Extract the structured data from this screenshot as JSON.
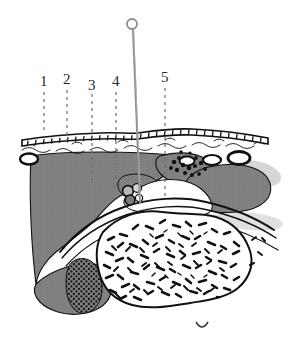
{
  "figure": {
    "kind": "anatomical-cross-section",
    "background_color": "#ffffff"
  },
  "palette": {
    "outline": "#111111",
    "soft_tissue_gray": "#808080",
    "soft_tissue_gray_dark": "#6f6f6f",
    "cartilage_white": "#ffffff",
    "needle_gray": "#8a8a8a",
    "label_color": "#2b2b2b",
    "leader_color": "#6b6b6b",
    "shadow_gray": "#cfcfcf"
  },
  "labels": [
    {
      "id": "label-1",
      "text": "1",
      "x": 40,
      "y": 74,
      "leader_x": 44,
      "leader_y_start": 92,
      "leader_y_end": 131
    },
    {
      "id": "label-2",
      "text": "2",
      "x": 63,
      "y": 72,
      "leader_x": 67,
      "leader_y_start": 90,
      "leader_y_end": 141
    },
    {
      "id": "label-3",
      "text": "3",
      "x": 88,
      "y": 78,
      "leader_x": 92,
      "leader_y_start": 94,
      "leader_y_end": 182
    },
    {
      "id": "label-4",
      "text": "4",
      "x": 112,
      "y": 74,
      "leader_x": 116,
      "leader_y_start": 92,
      "leader_y_end": 190
    },
    {
      "id": "label-5",
      "text": "5",
      "x": 161,
      "y": 70,
      "leader_x": 165,
      "leader_y_start": 88,
      "leader_y_end": 197
    }
  ],
  "needle": {
    "name": "insertion-needle",
    "eye_center_x": 132,
    "eye_center_y": 24,
    "eye_radius": 5,
    "shaft_top_y": 29,
    "shaft_bottom_y": 202,
    "shaft_bottom_x": 140,
    "shaft_top_x": 133
  },
  "structures": {
    "epidermis": "epidermis-brick-layer",
    "dermis": "dermis-wavy-layer",
    "subcutaneous": "subcutaneous-soft-tissue",
    "vessels": "blood-vessel-ovals",
    "cartilage": "cartilage-white-zone",
    "cortical_bone": "cortical-bone-outline",
    "trabecular_bone": "trabecular-bone-speckle",
    "marrow_patch": "stippled-marrow-patch"
  }
}
